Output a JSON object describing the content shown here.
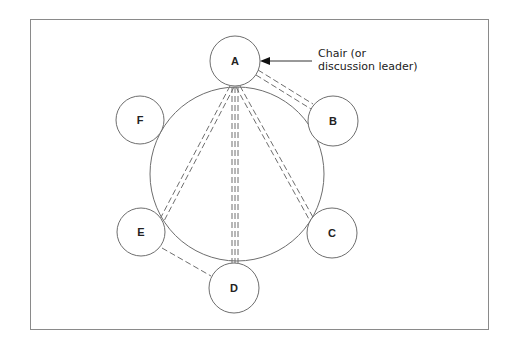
{
  "diagram": {
    "title": "",
    "annotation": {
      "line1": "Chair (or",
      "line2": "discussion leader)",
      "points_to": "A"
    },
    "table": {
      "shape": "circle"
    },
    "nodes": [
      {
        "id": "A",
        "label": "A",
        "role": "chair"
      },
      {
        "id": "B",
        "label": "B"
      },
      {
        "id": "C",
        "label": "C"
      },
      {
        "id": "D",
        "label": "D"
      },
      {
        "id": "E",
        "label": "E"
      },
      {
        "id": "F",
        "label": "F"
      }
    ],
    "connections": [
      {
        "from": "A",
        "to": "B",
        "lines": 2,
        "style": "dashed"
      },
      {
        "from": "A",
        "to": "C",
        "lines": 2,
        "style": "dashed"
      },
      {
        "from": "A",
        "to": "D",
        "lines": 3,
        "style": "dashed"
      },
      {
        "from": "A",
        "to": "E",
        "lines": 2,
        "style": "dashed"
      },
      {
        "from": "E",
        "to": "D",
        "lines": 1,
        "style": "dashed"
      }
    ],
    "colors": {
      "stroke": "#6e6e6e",
      "frame": "#8a8a8a",
      "text": "#222222"
    }
  }
}
